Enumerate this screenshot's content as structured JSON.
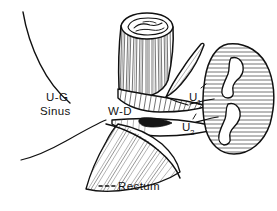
{
  "figure": {
    "background_color": "#ffffff",
    "ink_color": "#101010",
    "labels": [
      {
        "id": "ug-sinus",
        "name": "u-g-sinus-label",
        "line1": "U-G",
        "line2": "Sinus",
        "x": 46,
        "y": 101,
        "meaning": "urogenital sinus"
      },
      {
        "id": "wd",
        "name": "w-d-label",
        "text": "W-D",
        "x": 108,
        "y": 115,
        "meaning": "Wolffian duct"
      },
      {
        "id": "u1",
        "name": "u1-label",
        "base": "U",
        "sub": "1",
        "x": 189,
        "y": 101,
        "meaning": "ureter one"
      },
      {
        "id": "u2",
        "name": "u2-label",
        "base": "U",
        "sub": "2",
        "x": 182,
        "y": 131,
        "meaning": "ureter two"
      },
      {
        "id": "rectum",
        "name": "rectum-label",
        "text": "Rectum",
        "x": 118,
        "y": 190,
        "meaning": "rectum",
        "leader": "dashed"
      }
    ],
    "structures": [
      {
        "name": "urogenital-sinus-contour",
        "kind": "outline-curve"
      },
      {
        "name": "cut-cylinder-tube",
        "kind": "hatched-cylinder"
      },
      {
        "name": "wolffian-duct-wedge",
        "kind": "hatched-wedge"
      },
      {
        "name": "ureter-one-tube",
        "kind": "tube"
      },
      {
        "name": "ureter-two-tube",
        "kind": "tube"
      },
      {
        "name": "duplex-kidney",
        "kind": "hatched-organ"
      },
      {
        "name": "rectum-muscle",
        "kind": "hatched-taper"
      }
    ]
  }
}
